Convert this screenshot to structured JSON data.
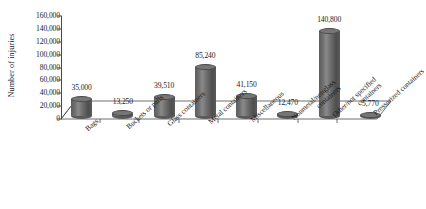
{
  "chart_data": {
    "type": "bar",
    "title": "",
    "xlabel": "",
    "ylabel": "Number of injuries",
    "ylim": [
      0,
      160000
    ],
    "ytick_labels": [
      "160,000",
      "140,000",
      "120,000",
      "100,000",
      "80,000",
      "60,000",
      "40,000",
      "20,000",
      "0"
    ],
    "ytick_values": [
      160000,
      140000,
      120000,
      100000,
      80000,
      60000,
      40000,
      20000,
      0
    ],
    "grid": false,
    "legend": "none",
    "categories": [
      "Bags",
      "Buckets or pails",
      "Glass containers",
      "Metal containers",
      "Miscellaneous",
      "Nonmetal/nonglass containers",
      "Other/not specified containers",
      "Pressurized containers"
    ],
    "category_lines": [
      [
        "Bags"
      ],
      [
        "Buckets or pails"
      ],
      [
        "Glass containers"
      ],
      [
        "Metal containers"
      ],
      [
        "Miscellaneous"
      ],
      [
        "Nonmetal/nonglass",
        "containers"
      ],
      [
        "Other/not specified",
        "containers"
      ],
      [
        "Pressurized containers"
      ]
    ],
    "values": [
      35000,
      13250,
      39510,
      85240,
      41150,
      12470,
      140800,
      5770
    ],
    "data_labels": [
      "35,000",
      "13,250",
      "39,510",
      "85,240",
      "41,150",
      "12,470",
      "140,800",
      "5,770"
    ],
    "bar_color": "#6b6b6b",
    "axis_color": "#4a4a4a",
    "style": "3d-cylinder"
  }
}
